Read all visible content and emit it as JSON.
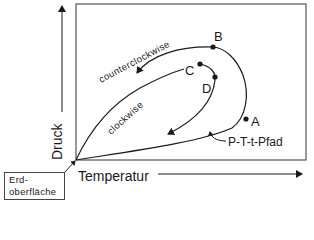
{
  "diagram": {
    "axes": {
      "y_label": "Druck",
      "x_label": "Temperatur"
    },
    "paths": {
      "counterclockwise_label": "counterclockwise",
      "clockwise_label": "clockwise",
      "ptt_label": "P-T-t-Pfad"
    },
    "points": [
      {
        "id": "A",
        "label": "A"
      },
      {
        "id": "B",
        "label": "B"
      },
      {
        "id": "C",
        "label": "C"
      },
      {
        "id": "D",
        "label": "D"
      }
    ],
    "origin_box": {
      "line1": "Erd-",
      "line2": "oberfläche"
    },
    "colors": {
      "ink": "#1a1a1a",
      "frame": "#555555",
      "background": "#ffffff"
    }
  }
}
